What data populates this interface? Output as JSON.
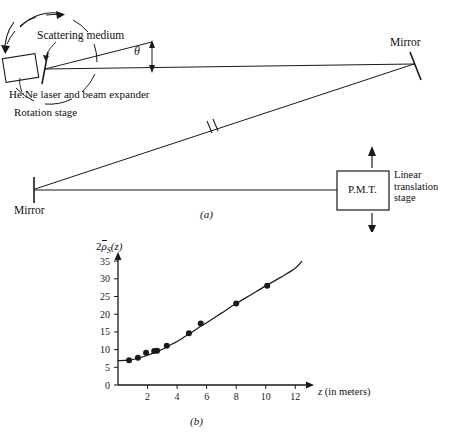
{
  "figure": {
    "panel_a": {
      "label": "(a)",
      "annotations": {
        "scattering_medium": "Scattering medium",
        "laser": "He:Ne laser and beam expander",
        "rotation_stage": "Rotation stage",
        "theta": "θ",
        "mirror_top": "Mirror",
        "mirror_bottom": "Mirror",
        "pmt": "P.M.T.",
        "linear_stage_line1": "Linear",
        "linear_stage_line2": "translation",
        "linear_stage_line3": "stage"
      }
    },
    "panel_b": {
      "label": "(b)"
    }
  },
  "chart_data": {
    "type": "scatter",
    "title": "",
    "ylabel": "2ρ̄_S(z)",
    "ylabel_parts": {
      "coef": "2",
      "rho": "ρ",
      "sub": "S",
      "arg": "(z)"
    },
    "xlabel": "z (in meters)",
    "xlabel_parts": {
      "var": "z",
      "unit": "(in meters)"
    },
    "xlim": [
      0,
      13.2
    ],
    "ylim": [
      0,
      37
    ],
    "xticks": [
      2,
      4,
      6,
      8,
      10,
      12
    ],
    "yticks": [
      0,
      5,
      10,
      15,
      20,
      25,
      30,
      35
    ],
    "grid": false,
    "legend": null,
    "points": [
      {
        "x": 0.75,
        "y": 7.0
      },
      {
        "x": 1.35,
        "y": 7.7
      },
      {
        "x": 1.9,
        "y": 9.1
      },
      {
        "x": 2.45,
        "y": 9.6
      },
      {
        "x": 2.65,
        "y": 9.7
      },
      {
        "x": 3.3,
        "y": 11.1
      },
      {
        "x": 4.8,
        "y": 14.6
      },
      {
        "x": 5.6,
        "y": 17.4
      },
      {
        "x": 8.0,
        "y": 23.0
      },
      {
        "x": 10.1,
        "y": 28.0
      }
    ],
    "curve": [
      {
        "x": 0.0,
        "y": 6.9
      },
      {
        "x": 0.5,
        "y": 6.95
      },
      {
        "x": 1.0,
        "y": 7.2
      },
      {
        "x": 1.5,
        "y": 7.7
      },
      {
        "x": 2.0,
        "y": 8.4
      },
      {
        "x": 2.5,
        "y": 9.2
      },
      {
        "x": 3.0,
        "y": 10.1
      },
      {
        "x": 3.5,
        "y": 11.2
      },
      {
        "x": 4.0,
        "y": 12.3
      },
      {
        "x": 4.5,
        "y": 13.6
      },
      {
        "x": 5.0,
        "y": 14.9
      },
      {
        "x": 5.5,
        "y": 16.3
      },
      {
        "x": 6.0,
        "y": 17.6
      },
      {
        "x": 7.0,
        "y": 20.3
      },
      {
        "x": 8.0,
        "y": 23.0
      },
      {
        "x": 9.0,
        "y": 25.5
      },
      {
        "x": 10.0,
        "y": 28.0
      },
      {
        "x": 11.0,
        "y": 30.4
      },
      {
        "x": 12.0,
        "y": 33.0
      },
      {
        "x": 12.45,
        "y": 35.0
      }
    ]
  },
  "colors": {
    "ink": "#1a1a1a",
    "background": "#ffffff"
  }
}
